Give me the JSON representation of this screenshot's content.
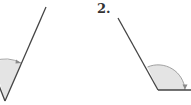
{
  "figures": [
    {
      "id": "angle-1",
      "label": "",
      "vertex": [
        5,
        101
      ],
      "rays": [
        [
          46,
          7
        ],
        [
          -10,
          78
        ]
      ],
      "arc_radius": 40,
      "arrow": "clockwise toward right ray",
      "fill": "#e4e4e4"
    },
    {
      "id": "angle-2",
      "label": "2.",
      "vertex": [
        158,
        90
      ],
      "rays": [
        [
          118,
          18
        ],
        [
          191,
          90
        ]
      ],
      "arc_radius": 27,
      "arrow": "clockwise toward horizontal ray",
      "fill": "#e4e4e4"
    }
  ],
  "colors": {
    "line": "#444444",
    "arc": "#888888",
    "fill": "#e4e4e4",
    "label": "#333333"
  }
}
